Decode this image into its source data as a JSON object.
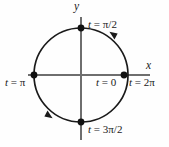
{
  "figure": {
    "type": "unit-circle-parametric",
    "background_color": "#fefefe",
    "stroke_color": "#1a1a1a",
    "axis_color": "#6e6e6e",
    "center": {
      "x": 81,
      "y": 75
    },
    "radius": 47,
    "direction": "counterclockwise"
  },
  "axes": {
    "x_label": "x",
    "y_label": "y"
  },
  "points": [
    {
      "name": "t-zero",
      "label_var": "t",
      "label_eq": " = ",
      "label_val": "0",
      "full": "t = 0",
      "angle_deg": 0,
      "px": 124,
      "py": 75
    },
    {
      "name": "t-two-pi",
      "label_var": "t",
      "label_eq": " = ",
      "label_val": "2π",
      "full": "t = 2π",
      "angle_deg": 360,
      "px": 124,
      "py": 75
    },
    {
      "name": "t-half-pi",
      "label_var": "t",
      "label_eq": " = ",
      "label_val": "π/2",
      "full": "t = π/2",
      "angle_deg": 90,
      "px": 81,
      "py": 28
    },
    {
      "name": "t-pi",
      "label_var": "t",
      "label_eq": " = ",
      "label_val": "π",
      "full": "t = π",
      "angle_deg": 180,
      "px": 34,
      "py": 75
    },
    {
      "name": "t-three-half-pi",
      "label_var": "t",
      "label_eq": " = ",
      "label_val": "3π/2",
      "full": "t = 3π/2",
      "angle_deg": 270,
      "px": 81,
      "py": 122
    }
  ],
  "arrows": [
    {
      "name": "arrow-upper-right",
      "angle_deg": 50,
      "direction": "counterclockwise"
    },
    {
      "name": "arrow-lower-left",
      "angle_deg": 230,
      "direction": "counterclockwise"
    }
  ]
}
